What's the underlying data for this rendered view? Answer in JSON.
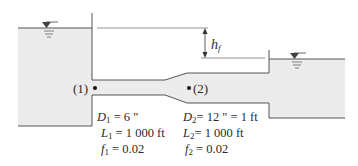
{
  "diagram": {
    "type": "two-reservoir pipe system with sudden/gradual expansion",
    "colors": {
      "water": "#ececec",
      "line": "#555555",
      "text": "#2a2a2a",
      "background": "#ffffff"
    },
    "head_loss_label": {
      "symbol": "h",
      "subscript": "f"
    },
    "points": [
      {
        "label": "(1)",
        "location": "pipe inlet, left reservoir"
      },
      {
        "label": "(2)",
        "location": "start of large pipe after expansion"
      }
    ],
    "pipe_1": {
      "D_symbol": "D",
      "D_sub": "1",
      "D_value": "= 6 \"",
      "L_symbol": "L",
      "L_sub": "1",
      "L_value": "= 1 000 ft",
      "f_symbol": "f",
      "f_sub": "1",
      "f_value": "= 0.02"
    },
    "pipe_2": {
      "D_symbol": "D",
      "D_sub": "2",
      "D_value": "= 12 \" = 1 ft",
      "L_symbol": "L",
      "L_sub": "2",
      "L_value": "= 1 000 ft",
      "f_symbol": "f",
      "f_sub": "2",
      "f_value": "= 0.02"
    }
  }
}
